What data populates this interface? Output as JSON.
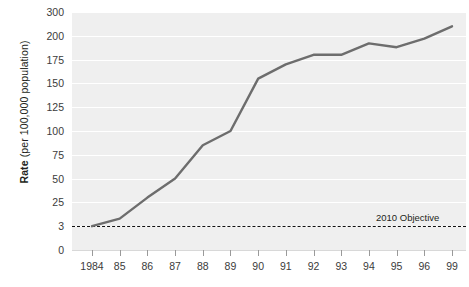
{
  "chart_data": {
    "type": "line",
    "title": "",
    "xlabel": "",
    "ylabel": "Rate (per 100,000 population)",
    "ylabel_bold_prefix": "Rate",
    "ylabel_rest": " (per 100,000 population)",
    "categories": [
      "1984",
      "85",
      "86",
      "87",
      "88",
      "89",
      "90",
      "91",
      "92",
      "93",
      "94",
      "95",
      "96",
      "99"
    ],
    "values": [
      3,
      10,
      30,
      50,
      85,
      100,
      155,
      170,
      180,
      180,
      192,
      188,
      197,
      240
    ],
    "yticks": [
      {
        "label": "300",
        "value": 300
      },
      {
        "label": "200",
        "value": 200
      },
      {
        "label": "175",
        "value": 175
      },
      {
        "label": "150",
        "value": 150
      },
      {
        "label": "125",
        "value": 125
      },
      {
        "label": "100",
        "value": 100
      },
      {
        "label": "75",
        "value": 75
      },
      {
        "label": "50",
        "value": 50
      },
      {
        "label": "25",
        "value": 25
      },
      {
        "label": "3",
        "value": 3
      },
      {
        "label": "0",
        "value": 0
      }
    ],
    "xticklabels": [
      "1984",
      "85",
      "86",
      "87",
      "88",
      "89",
      "90",
      "91",
      "92",
      "93",
      "94",
      "95",
      "96",
      "99"
    ],
    "reference_line": {
      "label": "2010 Objective",
      "value": 3,
      "style": "dashed"
    },
    "grid": true,
    "legend": "none",
    "series_color": "#6d6d6d",
    "plot_background": "#efefef",
    "gridline_color": "#ffffff",
    "reference_line_color": "#111111"
  }
}
